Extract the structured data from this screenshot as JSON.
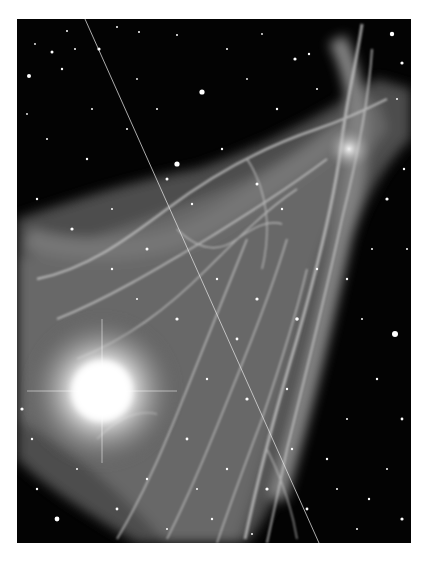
{
  "image": {
    "subject": "nebula photograph with star field",
    "description": "Black-and-white astronomical image showing filamentary nebula (veil-like wisps) extending from lower-left to upper-right, a very bright star glow in the lower-left, dense star field, and a thin diagonal satellite trail crossing from top-left to bottom-right.",
    "colors": {
      "background": "#ffffff",
      "sky": "#030303",
      "nebula": "#bdbdbd",
      "glow": "#ffffff"
    }
  }
}
